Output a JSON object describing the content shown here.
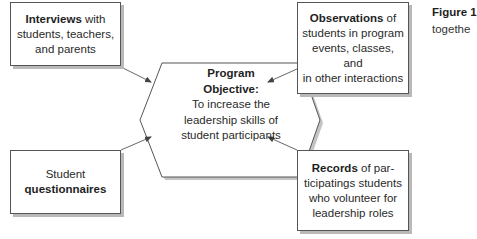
{
  "diagram": {
    "center": {
      "title_line1": "Program",
      "title_line2": "Objective:",
      "body_lines": [
        "To increase the",
        "leadership skills of",
        "student participants"
      ]
    },
    "boxes": {
      "interviews": {
        "bold": "Interviews",
        "rest_line1": " with",
        "line2": "students, teachers,",
        "line3": "and parents"
      },
      "observations": {
        "bold": "Observations",
        "rest_line1": " of",
        "line2": "students in program",
        "line3": "events, classes, and",
        "line4": "in other interactions"
      },
      "questionnaires": {
        "line1": "Student",
        "bold": "questionnaires"
      },
      "records": {
        "bold": "Records",
        "rest_line1": " of par-",
        "line2": "ticipatings students",
        "line3": "who volunteer for",
        "line4": "leadership roles"
      }
    },
    "arrows": [
      {
        "from": "interviews",
        "to": "center"
      },
      {
        "from": "observations",
        "to": "center"
      },
      {
        "from": "questionnaires",
        "to": "center"
      },
      {
        "from": "records",
        "to": "center"
      }
    ],
    "colors": {
      "stroke": "#555555",
      "shadow": "#b9b9b9",
      "text": "#2a2a2a"
    }
  },
  "caption": {
    "figure_label": "Figure 1",
    "text_fragment": "togethe"
  }
}
